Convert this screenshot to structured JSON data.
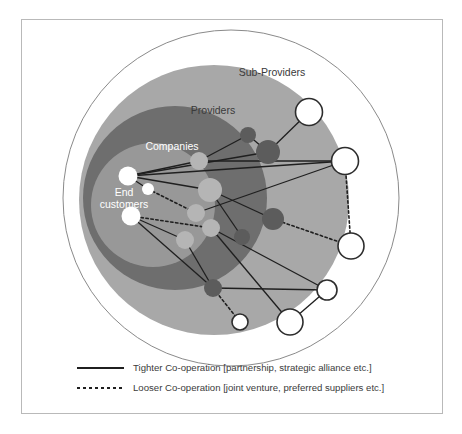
{
  "figure": {
    "title": "",
    "frame_color": "#b9b9b9",
    "background": "#ffffff"
  },
  "rings": [
    {
      "id": "sub-providers",
      "label": "Sub-Providers",
      "fill": "#ffffff",
      "stroke": "#8a8a8a",
      "cx": 231,
      "cy": 198,
      "r": 168,
      "label_x": 272,
      "label_y": 76
    },
    {
      "id": "providers",
      "label": "Providers",
      "fill": "#a8a8a8",
      "stroke": "none",
      "cx": 214,
      "cy": 200,
      "r": 135,
      "label_x": 213,
      "label_y": 114
    },
    {
      "id": "companies",
      "label": "Companies",
      "fill": "#6e6e6e",
      "stroke": "none",
      "cx": 175,
      "cy": 198,
      "r": 92,
      "label_x": 172,
      "label_y": 150
    },
    {
      "id": "end-customers",
      "label": "End\ncustomers",
      "label_line1": "End",
      "label_line2": "customers",
      "fill": "#989898",
      "stroke": "none",
      "cx": 153,
      "cy": 205,
      "r": 62,
      "label_x": 124,
      "label_y": 196
    }
  ],
  "nodes": [
    {
      "id": "ec1",
      "layer": "end-customers",
      "cx": 128,
      "cy": 176,
      "r": 9.5,
      "fill": "#ffffff",
      "stroke": "none"
    },
    {
      "id": "ec2",
      "layer": "end-customers",
      "cx": 148,
      "cy": 189,
      "r": 6.0,
      "fill": "#ffffff",
      "stroke": "none"
    },
    {
      "id": "ec3",
      "layer": "end-customers",
      "cx": 131,
      "cy": 216,
      "r": 9.5,
      "fill": "#ffffff",
      "stroke": "none"
    },
    {
      "id": "co1",
      "layer": "companies",
      "cx": 199,
      "cy": 161,
      "r": 9.0,
      "fill": "#b5b5b5",
      "stroke": "none"
    },
    {
      "id": "co2",
      "layer": "companies",
      "cx": 210,
      "cy": 190,
      "r": 12.0,
      "fill": "#b5b5b5",
      "stroke": "none"
    },
    {
      "id": "co3",
      "layer": "companies",
      "cx": 196,
      "cy": 213,
      "r": 9.0,
      "fill": "#b5b5b5",
      "stroke": "none"
    },
    {
      "id": "co4",
      "layer": "companies",
      "cx": 211,
      "cy": 228,
      "r": 9.0,
      "fill": "#b5b5b5",
      "stroke": "none"
    },
    {
      "id": "co5",
      "layer": "companies",
      "cx": 185,
      "cy": 240,
      "r": 9.0,
      "fill": "#b5b5b5",
      "stroke": "none"
    },
    {
      "id": "pr1",
      "layer": "providers",
      "cx": 248,
      "cy": 135,
      "r": 8.0,
      "fill": "#5c5c5c",
      "stroke": "none"
    },
    {
      "id": "pr2",
      "layer": "providers",
      "cx": 268,
      "cy": 152,
      "r": 12.0,
      "fill": "#5c5c5c",
      "stroke": "none"
    },
    {
      "id": "pr3",
      "layer": "providers",
      "cx": 273,
      "cy": 219,
      "r": 11.0,
      "fill": "#5c5c5c",
      "stroke": "none"
    },
    {
      "id": "pr4",
      "layer": "providers",
      "cx": 242,
      "cy": 237,
      "r": 8.0,
      "fill": "#5c5c5c",
      "stroke": "none"
    },
    {
      "id": "pr5",
      "layer": "providers",
      "cx": 213,
      "cy": 288,
      "r": 9.0,
      "fill": "#5c5c5c",
      "stroke": "none"
    },
    {
      "id": "sp1",
      "layer": "sub-providers",
      "cx": 309,
      "cy": 112,
      "r": 13.5,
      "fill": "#ffffff",
      "stroke": "#2d2d2d"
    },
    {
      "id": "sp2",
      "layer": "sub-providers",
      "cx": 345,
      "cy": 161,
      "r": 13.5,
      "fill": "#ffffff",
      "stroke": "#2d2d2d"
    },
    {
      "id": "sp3",
      "layer": "sub-providers",
      "cx": 351,
      "cy": 246,
      "r": 13.0,
      "fill": "#ffffff",
      "stroke": "#2d2d2d"
    },
    {
      "id": "sp4",
      "layer": "sub-providers",
      "cx": 327,
      "cy": 290,
      "r": 10.0,
      "fill": "#ffffff",
      "stroke": "#2d2d2d"
    },
    {
      "id": "sp5",
      "layer": "sub-providers",
      "cx": 290,
      "cy": 322,
      "r": 13.0,
      "fill": "#ffffff",
      "stroke": "#2d2d2d"
    },
    {
      "id": "sp6",
      "layer": "sub-providers",
      "cx": 240,
      "cy": 322,
      "r": 8.0,
      "fill": "#ffffff",
      "stroke": "#2d2d2d"
    }
  ],
  "links": [
    {
      "from": "ec1",
      "to": "co1",
      "style": "tight"
    },
    {
      "from": "ec1",
      "to": "co2",
      "style": "tight"
    },
    {
      "from": "ec1",
      "to": "pr2",
      "style": "tight"
    },
    {
      "from": "ec1",
      "to": "sp2",
      "style": "tight"
    },
    {
      "from": "ec1",
      "to": "ec2",
      "style": "tight"
    },
    {
      "from": "ec2",
      "to": "co3",
      "style": "loose"
    },
    {
      "from": "ec3",
      "to": "co4",
      "style": "loose"
    },
    {
      "from": "ec3",
      "to": "pr5",
      "style": "tight"
    },
    {
      "from": "ec3",
      "to": "co5",
      "style": "tight"
    },
    {
      "from": "co1",
      "to": "pr1",
      "style": "tight"
    },
    {
      "from": "co1",
      "to": "sp2",
      "style": "tight"
    },
    {
      "from": "pr1",
      "to": "pr2",
      "style": "tight"
    },
    {
      "from": "pr2",
      "to": "sp1",
      "style": "tight"
    },
    {
      "from": "co2",
      "to": "pr3",
      "style": "tight"
    },
    {
      "from": "co2",
      "to": "pr4",
      "style": "tight"
    },
    {
      "from": "co3",
      "to": "sp2",
      "style": "tight"
    },
    {
      "from": "co4",
      "to": "sp5",
      "style": "tight"
    },
    {
      "from": "co4",
      "to": "sp4",
      "style": "tight"
    },
    {
      "from": "co5",
      "to": "pr5",
      "style": "tight"
    },
    {
      "from": "pr3",
      "to": "sp3",
      "style": "loose"
    },
    {
      "from": "sp2",
      "to": "sp3",
      "style": "loose"
    },
    {
      "from": "pr5",
      "to": "sp4",
      "style": "tight"
    },
    {
      "from": "pr5",
      "to": "sp6",
      "style": "loose"
    },
    {
      "from": "sp4",
      "to": "sp5",
      "style": "tight"
    }
  ],
  "legend": {
    "items": [
      {
        "id": "tighter",
        "style": "tight",
        "label": "Tighter Co-operation [partnership, strategic alliance etc.]",
        "y": 371
      },
      {
        "id": "looser",
        "style": "loose",
        "label": "Looser Co-operation [joint venture, preferred suppliers etc.]",
        "y": 391
      }
    ],
    "sample_x1": 77,
    "sample_x2": 124,
    "text_x": 133
  },
  "styles": {
    "tight_stroke": "#1f1f1f",
    "tight_width": 1.3,
    "loose_stroke": "#1f1f1f",
    "loose_width": 1.6,
    "loose_dash": "2.4 2.6",
    "legend_tight_width": 2.0,
    "legend_loose_width": 2.0,
    "legend_loose_dash": "3 3"
  }
}
